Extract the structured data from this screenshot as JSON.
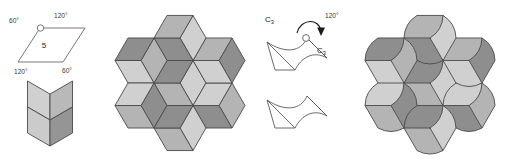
{
  "figure": {
    "background": "#ffffff",
    "width": 506,
    "height": 165
  },
  "palette": {
    "light": "#d0d0d0",
    "mid": "#b4b4b4",
    "dark": "#8e8e8e",
    "outline": "#4a4a4a",
    "white": "#ffffff",
    "text": "#333333"
  },
  "panels": [
    {
      "name": "rhombus-definition",
      "index": 1,
      "shape": "rhombus",
      "inner_label": "5",
      "vertex_marker": "open-circle",
      "angle_labels": [
        {
          "position": "top-left",
          "text": "60°"
        },
        {
          "position": "top-right",
          "text": "120°"
        },
        {
          "position": "bottom-left",
          "text": "120°"
        },
        {
          "position": "bottom-right",
          "text": "60°"
        }
      ],
      "cube": {
        "name": "hexagon-cube",
        "faces": 3,
        "face_shades": [
          "light",
          "mid",
          "dark"
        ]
      }
    },
    {
      "name": "rhombic-flower-tiling",
      "index": 2,
      "hexagon_count": 7,
      "rhombi_per_hexagon": 3,
      "face_shades": [
        "light",
        "mid",
        "dark"
      ],
      "arrangement": "hexagonal-flower"
    },
    {
      "name": "c3-rotation-tile",
      "index": 3,
      "symmetry_label_left": "C3",
      "symmetry_label_right": "C3",
      "rotation_angle": "120°",
      "rotation_center_marker": "open-circle",
      "derived_tile": {
        "name": "curved-rhombus-tile",
        "fill": "white",
        "edges": "one-concave-one-convex"
      }
    },
    {
      "name": "curved-flower-tiling",
      "index": 4,
      "hexagon_count": 7,
      "tiles_per_hexagon": 3,
      "face_shades": [
        "light",
        "mid",
        "dark"
      ],
      "arrangement": "hexagonal-flower",
      "edge_style": "curved"
    }
  ]
}
